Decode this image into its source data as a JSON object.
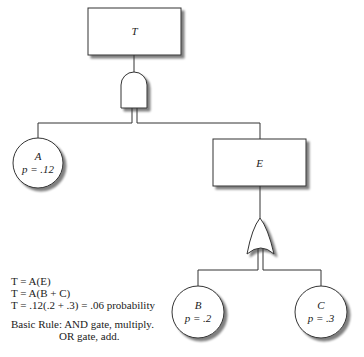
{
  "diagram": {
    "type": "fault-tree",
    "top_event": {
      "label": "T"
    },
    "and_gate": {
      "name": "AND"
    },
    "basic_event_a": {
      "label": "A",
      "prob": "p = .12"
    },
    "intermediate_event": {
      "label": "E"
    },
    "or_gate": {
      "name": "OR"
    },
    "basic_event_b": {
      "label": "B",
      "prob": "p = .2"
    },
    "basic_event_c": {
      "label": "C",
      "prob": "p = .3"
    }
  },
  "equations": [
    "T = A(E)",
    "T = A(B + C)",
    "T = .12(.2 + .3) = .06 probability"
  ],
  "rule": {
    "line1": "Basic Rule: AND gate, multiply.",
    "line2": "OR gate, add."
  }
}
